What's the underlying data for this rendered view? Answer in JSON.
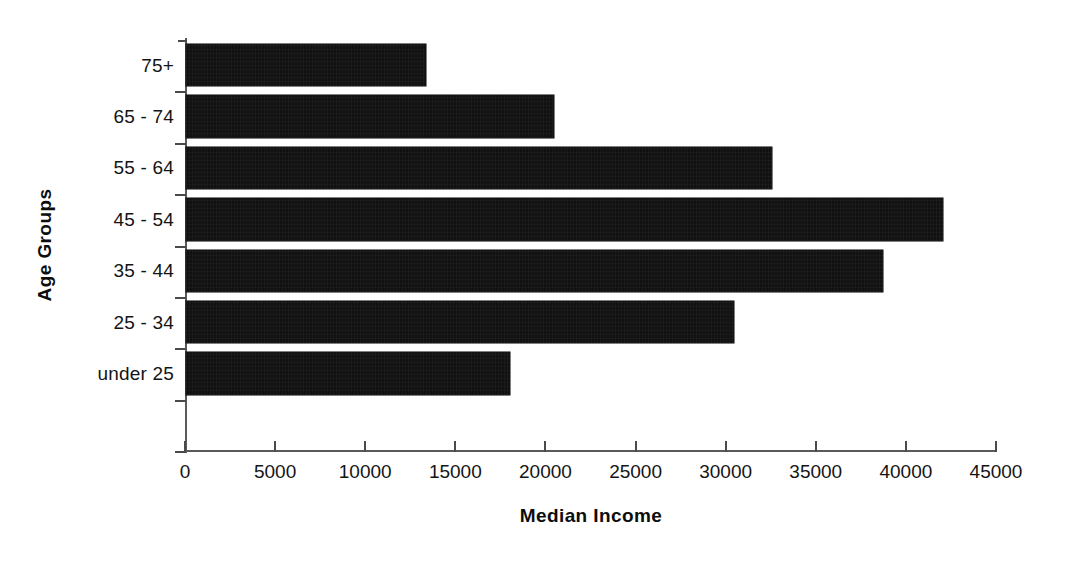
{
  "chart_data": {
    "type": "bar",
    "orientation": "horizontal",
    "title": "",
    "xlabel": "Median Income",
    "ylabel": "Age Groups",
    "categories": [
      "under 25",
      "25 - 34",
      "35 - 44",
      "45 - 54",
      "55 - 64",
      "65 - 74",
      "75+"
    ],
    "values": [
      18000,
      30400,
      38700,
      42000,
      32500,
      20400,
      13300
    ],
    "xlim": [
      0,
      45000
    ],
    "xticks": [
      0,
      5000,
      10000,
      15000,
      20000,
      25000,
      30000,
      35000,
      40000,
      45000
    ],
    "xtick_labels": [
      "0",
      "5000",
      "10000",
      "15000",
      "20000",
      "25000",
      "30000",
      "35000",
      "40000",
      "45000"
    ],
    "grid": false,
    "legend": false,
    "bar_color": "#111111",
    "axis_color": "#5a5a5a"
  },
  "axes": {
    "x_title": "Median Income",
    "y_title": "Age Groups"
  },
  "y_categories": [
    {
      "label": "75+",
      "value": 13300
    },
    {
      "label": "65 - 74",
      "value": 20400
    },
    {
      "label": "55 - 64",
      "value": 32500
    },
    {
      "label": "45 - 54",
      "value": 42000
    },
    {
      "label": "35 - 44",
      "value": 38700
    },
    {
      "label": "25 - 34",
      "value": 30400
    },
    {
      "label": "under 25",
      "value": 18000
    }
  ],
  "x_ticks": [
    {
      "label": "0",
      "value": 0
    },
    {
      "label": "5000",
      "value": 5000
    },
    {
      "label": "10000",
      "value": 10000
    },
    {
      "label": "15000",
      "value": 15000
    },
    {
      "label": "20000",
      "value": 20000
    },
    {
      "label": "25000",
      "value": 25000
    },
    {
      "label": "30000",
      "value": 30000
    },
    {
      "label": "35000",
      "value": 35000
    },
    {
      "label": "40000",
      "value": 40000
    },
    {
      "label": "45000",
      "value": 45000
    }
  ]
}
